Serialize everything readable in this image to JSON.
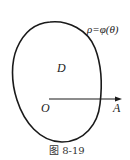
{
  "figure": {
    "curve_label": "ρ=φ(θ)",
    "region_label": "D",
    "origin_label": "O",
    "ray_end_label": "A",
    "caption": "图 8-19"
  },
  "colors": {
    "stroke": "#1a1a1a",
    "background": "#ffffff"
  }
}
